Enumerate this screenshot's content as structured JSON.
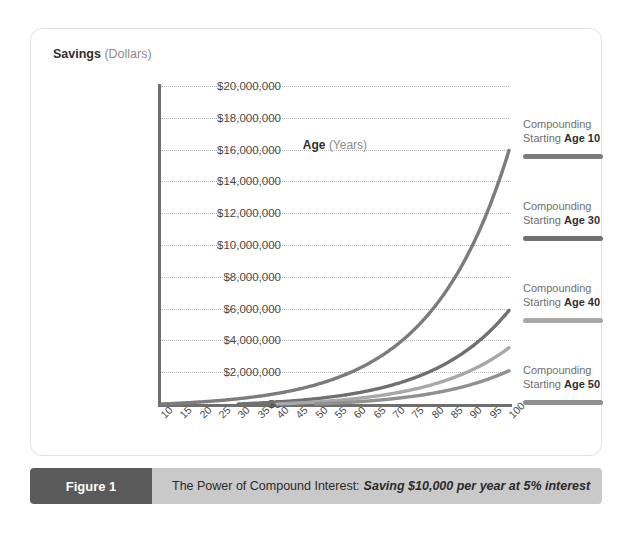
{
  "figure": {
    "number_label": "Figure 1",
    "caption_lead": "The Power of Compound Interest:",
    "caption_emphasis": "Saving $10,000 per year at 5% interest"
  },
  "axis": {
    "y_title_bold": "Savings",
    "y_title_rest": "(Dollars)",
    "x_title_bold": "Age",
    "x_title_rest": "(Years)"
  },
  "legend": {
    "entries": [
      {
        "line1": "Compounding",
        "line2_prefix": "Starting ",
        "line2_bold": "Age 10",
        "color": "#7c7c7c"
      },
      {
        "line1": "Compounding",
        "line2_prefix": "Starting ",
        "line2_bold": "Age 30",
        "color": "#707070"
      },
      {
        "line1": "Compounding",
        "line2_prefix": "Starting ",
        "line2_bold": "Age 40",
        "color": "#a8a8a8"
      },
      {
        "line1": "Compounding",
        "line2_prefix": "Starting ",
        "line2_bold": "Age 50",
        "color": "#909090"
      }
    ]
  },
  "colors": {
    "grid": "#b9b9b9",
    "axis": "#6e6e6e",
    "caption_bar": "#c9c9c9",
    "caption_block": "#5a5a5a",
    "card_border": "#e3e3e3"
  },
  "chart_data": {
    "type": "line",
    "title": "The Power of Compound Interest: Saving $10,000 per year at 5% interest",
    "xlabel": "Age (Years)",
    "ylabel": "Savings (Dollars)",
    "xlim": [
      10,
      100
    ],
    "ylim": [
      0,
      20000000
    ],
    "ytick_step": 2000000,
    "grid": true,
    "legend_position": "right",
    "annual_contribution": 10000,
    "interest_rate_percent": 5,
    "ytick_labels": [
      "$0",
      "$2,000,000",
      "$4,000,000",
      "$6,000,000",
      "$8,000,000",
      "$10,000,000",
      "$12,000,000",
      "$14,000,000",
      "$16,000,000",
      "$18,000,000",
      "$20,000,000"
    ],
    "x": [
      10,
      15,
      20,
      25,
      30,
      35,
      40,
      45,
      50,
      55,
      60,
      65,
      70,
      75,
      80,
      85,
      90,
      95,
      100
    ],
    "xtick_labels": [
      "10",
      "15",
      "20",
      "25",
      "30",
      "35",
      "40",
      "45",
      "50",
      "55",
      "60",
      "65",
      "70",
      "75",
      "80",
      "85",
      "90",
      "95",
      "100"
    ],
    "series": [
      {
        "name": "Compounding Starting Age 10",
        "color": "#7c7c7c",
        "start_age": 10,
        "values": [
          0,
          55256,
          125779,
          215786,
          330660,
          477271,
          664388,
          903203,
          1207998,
          1596904,
          2092987,
          2726280,
          3534322,
          4565309,
          5880865,
          7559629,
          9701907,
          12435577,
          15925977
        ]
      },
      {
        "name": "Compounding Starting Age 30",
        "color": "#707070",
        "start_age": 30,
        "values": [
          null,
          null,
          null,
          null,
          0,
          55256,
          125779,
          215786,
          330660,
          477271,
          664388,
          903203,
          1207998,
          1596904,
          2092987,
          2726280,
          3534322,
          4565309,
          5880865
        ]
      },
      {
        "name": "Compounding Starting Age 40",
        "color": "#a8a8a8",
        "start_age": 40,
        "values": [
          null,
          null,
          null,
          null,
          null,
          null,
          0,
          55256,
          125779,
          215786,
          330660,
          477271,
          664388,
          903203,
          1207998,
          1596904,
          2092987,
          2726280,
          3534322
        ]
      },
      {
        "name": "Compounding Starting Age 50",
        "color": "#909090",
        "start_age": 50,
        "values": [
          null,
          null,
          null,
          null,
          null,
          null,
          null,
          null,
          0,
          55256,
          125779,
          215786,
          330660,
          477271,
          664388,
          903203,
          1207998,
          1596904,
          2092987
        ]
      }
    ],
    "endpoint_values_at_age_100": {
      "age_10": 15925977,
      "age_30": 5880865,
      "age_40": 3534322,
      "age_50": 2092987
    }
  }
}
